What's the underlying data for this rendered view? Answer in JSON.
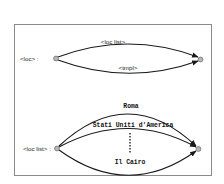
{
  "diagram": {
    "top_section": {
      "rule_label": "<loc> :",
      "edges": [
        {
          "label": "<loc list>"
        },
        {
          "label": "<tmpl>"
        }
      ]
    },
    "bottom_section": {
      "rule_label": "<loc list> :",
      "edges": [
        {
          "label": "Roma"
        },
        {
          "label": "Stati Uniti d'America"
        },
        {
          "label": "Il Cairo"
        }
      ],
      "ellipsis": "vertical-dotted-line"
    },
    "colors": {
      "frame": "#8a8a8a",
      "edge": "#1a1a1a",
      "node_fill": "#b8b8b8",
      "node_stroke": "#6e6e6e",
      "background": "#ffffff"
    }
  }
}
